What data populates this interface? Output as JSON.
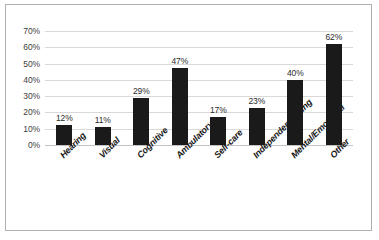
{
  "chart_data": {
    "type": "bar",
    "title": "",
    "xlabel": "",
    "ylabel": "",
    "categories": [
      "Hearing",
      "Visual",
      "Cognitive",
      "Ambulatory",
      "Self-care",
      "Independent Living",
      "Mental/Emotional",
      "Other"
    ],
    "values": [
      12,
      11,
      29,
      47,
      17,
      23,
      40,
      62
    ],
    "value_labels": [
      "12%",
      "11%",
      "29%",
      "47%",
      "17%",
      "23%",
      "40%",
      "62%"
    ],
    "ylim": [
      0,
      70
    ],
    "ytick_labels": [
      "0%",
      "10%",
      "20%",
      "30%",
      "40%",
      "50%",
      "60%",
      "70%"
    ],
    "ytick_values": [
      0,
      10,
      20,
      30,
      40,
      50,
      60,
      70
    ],
    "grid": true,
    "legend": false,
    "bar_color": "#1a1a1a",
    "gridline_color": "#d9d9d9",
    "frame_color": "#b0b0b0"
  }
}
